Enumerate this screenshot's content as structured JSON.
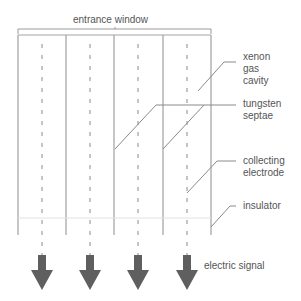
{
  "diagram": {
    "title_label": "entrance window",
    "labels": {
      "xenon": "xenon\ngas\ncavity",
      "tungsten": "tungsten\nseptae",
      "electrode": "collecting\nelectrode",
      "insulator": "insulator",
      "signal": "electric signal"
    },
    "colors": {
      "line": "#9a9a9a",
      "dash": "#8a8a8a",
      "arrow": "#5f5f5f",
      "text": "#555555"
    },
    "cells": 4
  }
}
